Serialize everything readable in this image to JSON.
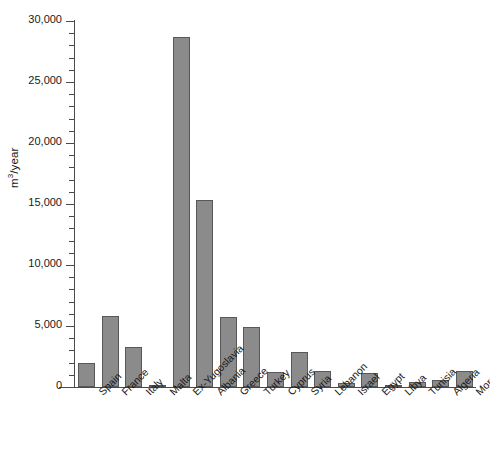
{
  "chart_data": {
    "type": "bar",
    "title": "",
    "subtitle": "",
    "xlabel": "",
    "ylabel": "m3/year",
    "ylabel_html": "m<sup>3</sup>/year",
    "ylim": [
      0,
      30000
    ],
    "ytick_step": 5000,
    "yminor_step": 1000,
    "grid": false,
    "legend": "none",
    "bar_fill": "#8b8b8b",
    "bar_edge": "#585858",
    "axis_color": "#4a4a4a",
    "ytick_labels": [
      "30,000",
      "25,000",
      "20,000",
      "15,000",
      "10,000",
      "5,000",
      "0"
    ],
    "ytick_values": [
      30000,
      25000,
      20000,
      15000,
      10000,
      5000,
      0
    ],
    "categories": [
      "Spain",
      "France",
      "Italy",
      "Malta",
      "Ex-Yugoslavia",
      "Albania",
      "Greece",
      "Turkey",
      "Cyprus",
      "Syria",
      "Lebanon",
      "Israel",
      "Egypt",
      "Libya",
      "Tunisia",
      "Algeria",
      "Morocco"
    ],
    "values": [
      1950,
      5800,
      3250,
      150,
      28700,
      15350,
      5750,
      4900,
      1250,
      2900,
      1350,
      300,
      1150,
      200,
      450,
      550,
      1350
    ]
  }
}
